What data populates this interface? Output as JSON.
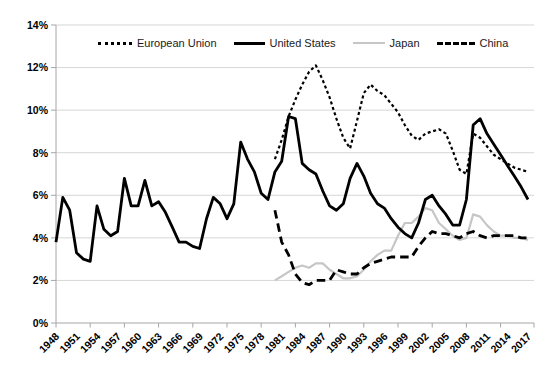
{
  "chart_data": {
    "type": "line",
    "title": "",
    "xlabel": "",
    "ylabel": "",
    "x_start": 1948,
    "x_end": 2017,
    "ylim": [
      0,
      14
    ],
    "y_unit": "percent",
    "grid": "horizontal",
    "legend_position": "top",
    "x_tick_labels": [
      "1948",
      "1951",
      "1954",
      "1957",
      "1960",
      "1963",
      "1966",
      "1969",
      "1972",
      "1975",
      "1978",
      "1981",
      "1984",
      "1987",
      "1990",
      "1993",
      "1996",
      "1999",
      "2002",
      "2005",
      "2008",
      "2011",
      "2014",
      "2017"
    ],
    "y_tick_labels": [
      "0%",
      "2%",
      "4%",
      "6%",
      "8%",
      "10%",
      "12%",
      "14%"
    ],
    "colors": {
      "line_black": "#000000",
      "japan_gray": "#c6c6c6",
      "gridline": "#d6d6d6",
      "axis": "#a6a6a6",
      "label_text": "#000000"
    },
    "series": [
      {
        "name": "European Union",
        "style": "dotted",
        "color": "#000000",
        "start_year": 1980,
        "values": [
          7.7,
          8.6,
          9.7,
          10.5,
          11.2,
          11.8,
          12.1,
          11.4,
          10.6,
          9.6,
          8.7,
          8.2,
          9.5,
          10.8,
          11.2,
          10.9,
          10.7,
          10.3,
          9.9,
          9.3,
          8.8,
          8.6,
          8.9,
          9.0,
          9.1,
          8.9,
          8.1,
          7.2,
          7.0,
          8.9,
          8.7,
          8.3,
          7.9,
          7.7,
          7.5,
          7.3,
          7.2,
          7.1
        ]
      },
      {
        "name": "United States",
        "style": "solid",
        "color": "#000000",
        "start_year": 1948,
        "values": [
          3.8,
          5.9,
          5.3,
          3.3,
          3.0,
          2.9,
          5.5,
          4.4,
          4.1,
          4.3,
          6.8,
          5.5,
          5.5,
          6.7,
          5.5,
          5.7,
          5.2,
          4.5,
          3.8,
          3.8,
          3.6,
          3.5,
          4.9,
          5.9,
          5.6,
          4.9,
          5.6,
          8.5,
          7.7,
          7.1,
          6.1,
          5.8,
          7.1,
          7.6,
          9.7,
          9.6,
          7.5,
          7.2,
          7.0,
          6.2,
          5.5,
          5.3,
          5.6,
          6.8,
          7.5,
          6.9,
          6.1,
          5.6,
          5.4,
          4.9,
          4.5,
          4.2,
          4.0,
          4.7,
          5.8,
          6.0,
          5.5,
          5.1,
          4.6,
          4.6,
          5.8,
          9.3,
          9.6,
          8.9,
          8.4,
          7.9,
          7.4,
          6.9,
          6.4,
          5.8
        ]
      },
      {
        "name": "Japan",
        "style": "solid",
        "color": "#c6c6c6",
        "start_year": 1980,
        "values": [
          2.0,
          2.2,
          2.4,
          2.6,
          2.7,
          2.6,
          2.8,
          2.8,
          2.5,
          2.3,
          2.1,
          2.1,
          2.2,
          2.5,
          2.9,
          3.2,
          3.4,
          3.4,
          4.1,
          4.7,
          4.7,
          5.0,
          5.4,
          5.3,
          4.7,
          4.4,
          4.1,
          3.9,
          4.0,
          5.1,
          5.0,
          4.6,
          4.3,
          4.1,
          4.1,
          4.0,
          4.0,
          3.9
        ]
      },
      {
        "name": "China",
        "style": "dashed",
        "color": "#000000",
        "start_year": 1980,
        "values": [
          5.3,
          3.8,
          3.2,
          2.3,
          1.9,
          1.8,
          2.0,
          2.0,
          2.0,
          2.5,
          2.4,
          2.3,
          2.3,
          2.6,
          2.8,
          2.9,
          3.0,
          3.1,
          3.1,
          3.1,
          3.1,
          3.6,
          4.0,
          4.3,
          4.2,
          4.2,
          4.1,
          4.0,
          4.2,
          4.3,
          4.1,
          4.0,
          4.1,
          4.1,
          4.1,
          4.1,
          4.0,
          4.0
        ]
      }
    ]
  }
}
